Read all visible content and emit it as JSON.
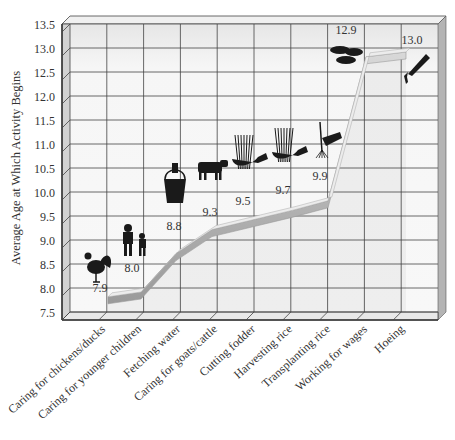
{
  "chart_data": {
    "type": "line",
    "title": "",
    "xlabel": "",
    "ylabel": "Average Age at Which Activity Begins",
    "ylim": [
      7.5,
      13.5
    ],
    "yticks": [
      "7.5",
      "8.0",
      "8.5",
      "9.0",
      "9.5",
      "10.0",
      "10.5",
      "11.0",
      "11.5",
      "12.0",
      "12.5",
      "13.0",
      "13.5"
    ],
    "grid": true,
    "legend": null,
    "categories": [
      "Caring for chickens/ducks",
      "Caring for younger children",
      "Fetching water",
      "Caring for goats/cattle",
      "Cutting fodder",
      "Harvesting rice",
      "Transplanting rice",
      "Working for wages",
      "Hoeing"
    ],
    "values": [
      7.9,
      8.0,
      8.8,
      9.3,
      9.5,
      9.7,
      9.9,
      12.9,
      13.0
    ],
    "value_labels": [
      "7.9",
      "8.0",
      "8.8",
      "9.3",
      "9.5",
      "9.7",
      "9.9",
      "12.9",
      "13.0"
    ],
    "icons": [
      "rooster-icon",
      "children-icon",
      "water-bucket-icon",
      "cow-icon",
      "fodder-sickle-icon",
      "rice-sickle-icon",
      "rice-seedling-icon",
      "coins-icon",
      "hoe-icon"
    ],
    "style": "3D box with gray ribbon line",
    "colors": {
      "ribbon": "#b8b8b8",
      "grid": "#333333",
      "panel": "#f4f4f4",
      "side": "#c8c8c8"
    }
  }
}
